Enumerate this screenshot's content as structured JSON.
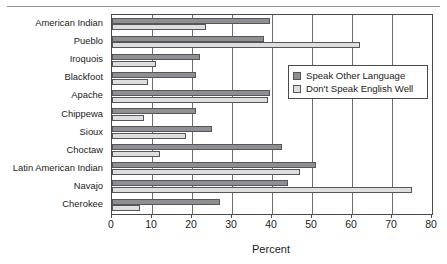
{
  "chart_data": {
    "type": "bar",
    "orientation": "horizontal",
    "title": "",
    "xlabel": "Percent",
    "ylabel": "",
    "xlim": [
      0,
      80
    ],
    "xticks": [
      0,
      10,
      20,
      30,
      40,
      50,
      60,
      70,
      80
    ],
    "grid": "vertical",
    "legend_position": "center-right",
    "categories": [
      "American Indian",
      "Pueblo",
      "Iroquois",
      "Blackfoot",
      "Apache",
      "Chippewa",
      "Sioux",
      "Choctaw",
      "Latin American Indian",
      "Navajo",
      "Cherokee"
    ],
    "series": [
      {
        "name": "Speak Other Language",
        "color": "#8f8f93",
        "values": [
          39.5,
          38,
          22,
          21,
          39.5,
          21,
          25,
          42.5,
          51,
          44,
          27
        ]
      },
      {
        "name": "Don't Speak English Well",
        "color": "#dedede",
        "values": [
          23.5,
          62,
          11,
          9,
          39,
          8,
          18.5,
          12,
          47,
          75,
          7
        ]
      }
    ]
  },
  "axis": {
    "x_title": "Percent",
    "tick_labels": [
      "0",
      "10",
      "20",
      "30",
      "40",
      "50",
      "60",
      "70",
      "80"
    ]
  },
  "legend": {
    "items": [
      {
        "label": "Speak Other Language",
        "swatch": "dark-gray-swatch"
      },
      {
        "label": "Don't Speak English Well",
        "swatch": "light-gray-swatch"
      }
    ]
  },
  "colors": {
    "series_dark": "#8f8f93",
    "series_light": "#dedede",
    "axis": "#4a4a4a",
    "grid": "#6e6e6e",
    "text": "#1b1b1b"
  }
}
